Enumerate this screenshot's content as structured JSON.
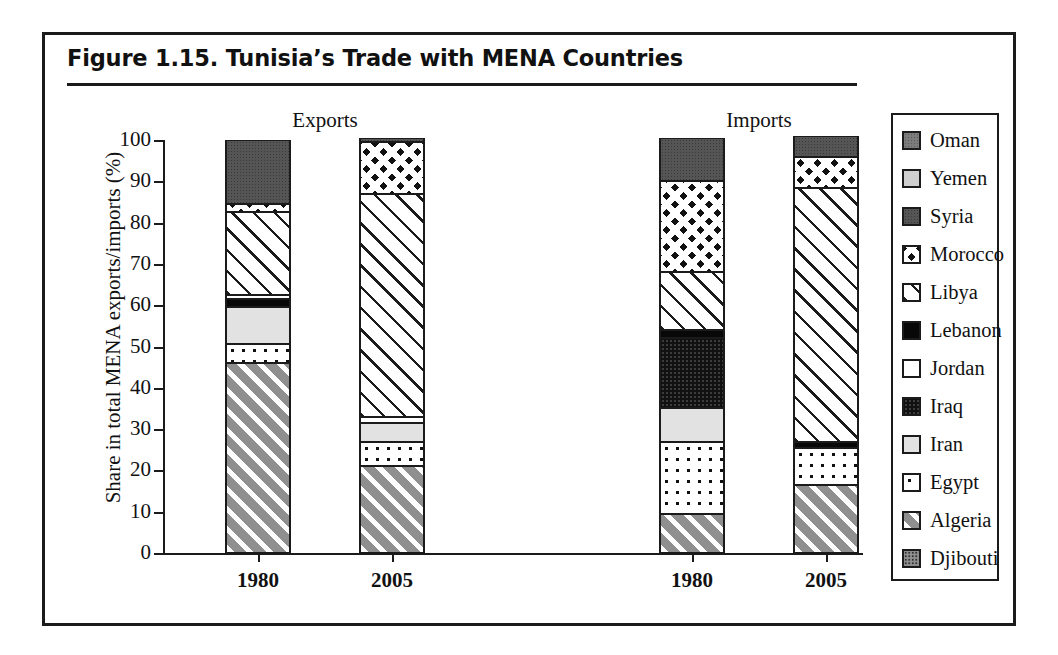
{
  "figure": {
    "title": "Figure 1.15.  Tunisia’s Trade with MENA Countries"
  },
  "legend": {
    "items": [
      {
        "label": "Oman",
        "key": "oman"
      },
      {
        "label": "Yemen",
        "key": "yemen"
      },
      {
        "label": "Syria",
        "key": "syria"
      },
      {
        "label": "Morocco",
        "key": "morocco"
      },
      {
        "label": "Libya",
        "key": "libya"
      },
      {
        "label": "Lebanon",
        "key": "lebanon"
      },
      {
        "label": "Jordan",
        "key": "jordan"
      },
      {
        "label": "Iraq",
        "key": "iraq"
      },
      {
        "label": "Iran",
        "key": "iran"
      },
      {
        "label": "Egypt",
        "key": "egypt"
      },
      {
        "label": "Algeria",
        "key": "algeria"
      },
      {
        "label": "Djibouti",
        "key": "djibouti"
      }
    ]
  },
  "chart_data": {
    "type": "bar",
    "subtype": "stacked-vertical",
    "title": "Figure 1.15.  Tunisia’s Trade with MENA Countries",
    "xlabel": "",
    "ylabel": "Share in total MENA exports/imports (%)",
    "ylim": [
      0,
      100
    ],
    "yticks": [
      0,
      10,
      20,
      30,
      40,
      50,
      60,
      70,
      80,
      90,
      100
    ],
    "ytick_labels": [
      "0",
      "10",
      "20",
      "30",
      "40",
      "50",
      "60",
      "70",
      "80",
      "90",
      "100"
    ],
    "grid": false,
    "legend_position": "right",
    "group_labels": [
      "Exports",
      "Imports"
    ],
    "categories": [
      "1980",
      "2005",
      "1980",
      "2005"
    ],
    "bars": [
      {
        "group": "Exports",
        "category": "1980",
        "segments": [
          {
            "name": "Algeria",
            "key": "algeria",
            "value": 46.0
          },
          {
            "name": "Egypt",
            "key": "egypt",
            "value": 4.5
          },
          {
            "name": "Iran",
            "key": "iran",
            "value": 9.0
          },
          {
            "name": "Lebanon",
            "key": "lebanon",
            "value": 2.0
          },
          {
            "name": "Jordan",
            "key": "jordan",
            "value": 1.0
          },
          {
            "name": "Libya",
            "key": "libya",
            "value": 20.0
          },
          {
            "name": "Morocco",
            "key": "morocco",
            "value": 2.0
          },
          {
            "name": "Syria",
            "key": "syria",
            "value": 15.5
          }
        ],
        "total": 100.0
      },
      {
        "group": "Exports",
        "category": "2005",
        "segments": [
          {
            "name": "Algeria",
            "key": "algeria",
            "value": 21.0
          },
          {
            "name": "Egypt",
            "key": "egypt",
            "value": 6.0
          },
          {
            "name": "Iran",
            "key": "iran",
            "value": 4.5
          },
          {
            "name": "Jordan",
            "key": "jordan",
            "value": 1.5
          },
          {
            "name": "Libya",
            "key": "libya",
            "value": 54.0
          },
          {
            "name": "Morocco",
            "key": "morocco",
            "value": 12.5
          },
          {
            "name": "Syria",
            "key": "syria",
            "value": 1.0
          }
        ],
        "total": 100.5
      },
      {
        "group": "Imports",
        "category": "1980",
        "segments": [
          {
            "name": "Algeria",
            "key": "algeria",
            "value": 9.5
          },
          {
            "name": "Egypt",
            "key": "egypt",
            "value": 17.5
          },
          {
            "name": "Iran",
            "key": "iran",
            "value": 8.0
          },
          {
            "name": "Iraq",
            "key": "iraq",
            "value": 17.0
          },
          {
            "name": "Lebanon",
            "key": "lebanon",
            "value": 2.0
          },
          {
            "name": "Libya",
            "key": "libya",
            "value": 14.0
          },
          {
            "name": "Morocco",
            "key": "morocco",
            "value": 22.0
          },
          {
            "name": "Syria",
            "key": "syria",
            "value": 10.5
          }
        ],
        "total": 100.5
      },
      {
        "group": "Imports",
        "category": "2005",
        "segments": [
          {
            "name": "Algeria",
            "key": "algeria",
            "value": 16.5
          },
          {
            "name": "Egypt",
            "key": "egypt",
            "value": 9.0
          },
          {
            "name": "Lebanon",
            "key": "lebanon",
            "value": 1.5
          },
          {
            "name": "Libya",
            "key": "libya",
            "value": 61.5
          },
          {
            "name": "Morocco",
            "key": "morocco",
            "value": 7.5
          },
          {
            "name": "Syria",
            "key": "syria",
            "value": 5.0
          }
        ],
        "total": 101.0
      }
    ]
  }
}
